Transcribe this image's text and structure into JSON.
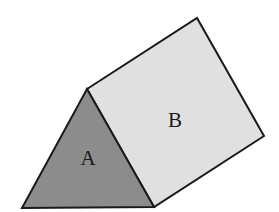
{
  "diagram": {
    "type": "triangular-prism",
    "background": "#ffffff",
    "stroke_color": "#1a1a1a",
    "faces": [
      {
        "id": "A",
        "label": "A",
        "shape": "triangle",
        "fill": "#8c8c8c",
        "points": "22,208 87,89 154,207",
        "label_pos": {
          "x": 88,
          "y": 165
        }
      },
      {
        "id": "B",
        "label": "B",
        "shape": "parallelogram",
        "fill": "#e0e0e0",
        "points": "87,89 197,18 264,136 154,207",
        "label_pos": {
          "x": 175,
          "y": 127
        }
      }
    ]
  }
}
